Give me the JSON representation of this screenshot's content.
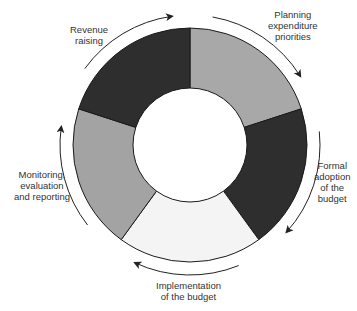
{
  "diagram": {
    "type": "cycle-donut",
    "center": [
      190,
      145
    ],
    "outer_radius": 117,
    "inner_radius": 57,
    "stages": [
      {
        "name": "Planning expenditure priorities",
        "lines": [
          "Planning",
          "expenditure",
          "priorities"
        ],
        "color": "#a8a8a8",
        "start_deg": 0,
        "end_deg": 72
      },
      {
        "name": "Formal adoption of the budget",
        "lines": [
          "Formal",
          "adoption",
          "of the",
          "budget"
        ],
        "color": "#2e2e2e",
        "start_deg": 72,
        "end_deg": 144
      },
      {
        "name": "Implementation of the budget",
        "lines": [
          "Implementation",
          "of the budget"
        ],
        "color": "#f4f4f4",
        "start_deg": 144,
        "end_deg": 216
      },
      {
        "name": "Monitoring, evaluation and reporting",
        "lines": [
          "Monitoring,",
          "evaluation",
          "and reporting"
        ],
        "color": "#a3a3a3",
        "start_deg": 216,
        "end_deg": 288
      },
      {
        "name": "Revenue raising",
        "lines": [
          "Revenue",
          "raising"
        ],
        "color": "#2e2e2e",
        "start_deg": 288,
        "end_deg": 360
      }
    ],
    "flow_direction": "clockwise"
  }
}
